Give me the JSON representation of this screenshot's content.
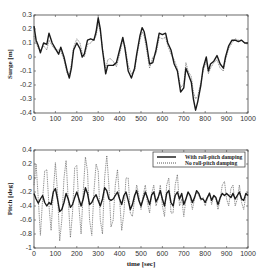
{
  "chart_data": [
    {
      "type": "line",
      "title": "",
      "xlabel": "",
      "ylabel": "Surge [m]",
      "xlim": [
        0,
        1000
      ],
      "ylim": [
        -0.4,
        0.3
      ],
      "xticks": [
        0,
        100,
        200,
        300,
        400,
        500,
        600,
        700,
        800,
        900,
        1000
      ],
      "yticks": [
        0.3,
        0.2,
        0.1,
        0,
        -0.1,
        -0.2,
        -0.3,
        -0.4
      ],
      "ytick_labels": [
        "0.3",
        "0.2",
        "0.1",
        "0",
        "-0.1",
        "-0.2",
        "-0.3",
        "-0.4"
      ],
      "grid": false,
      "legend": null,
      "x": [
        0,
        10,
        20,
        30,
        45,
        60,
        70,
        85,
        100,
        115,
        125,
        140,
        155,
        165,
        175,
        185,
        200,
        215,
        225,
        235,
        250,
        265,
        280,
        290,
        300,
        310,
        320,
        335,
        345,
        355,
        370,
        385,
        400,
        415,
        425,
        440,
        455,
        470,
        480,
        495,
        505,
        515,
        525,
        540,
        555,
        570,
        585,
        600,
        615,
        625,
        640,
        655,
        670,
        685,
        700,
        710,
        720,
        735,
        745,
        755,
        765,
        780,
        790,
        805,
        815,
        825,
        840,
        855,
        870,
        885,
        895,
        910,
        925,
        940,
        955,
        970,
        985,
        1000
      ],
      "series": [
        {
          "name": "With roll-pitch damping",
          "style": "solid",
          "values": [
            0.22,
            0.12,
            0.08,
            0.03,
            0.1,
            0.09,
            0.17,
            0.1,
            0.06,
            0.02,
            0.07,
            0.0,
            -0.1,
            -0.15,
            -0.08,
            0.05,
            0.1,
            0.06,
            0.0,
            0.02,
            0.12,
            0.13,
            0.12,
            0.18,
            0.28,
            0.2,
            0.05,
            -0.12,
            -0.06,
            -0.06,
            -0.06,
            -0.04,
            0.05,
            0.14,
            0.06,
            -0.1,
            -0.15,
            -0.08,
            0.02,
            0.15,
            0.21,
            0.18,
            0.1,
            -0.05,
            -0.04,
            0.05,
            0.17,
            0.16,
            0.17,
            0.1,
            0.05,
            -0.05,
            -0.1,
            -0.25,
            -0.22,
            -0.08,
            -0.12,
            -0.18,
            -0.3,
            -0.38,
            -0.32,
            -0.2,
            -0.08,
            0.0,
            -0.1,
            -0.05,
            -0.03,
            0.01,
            -0.05,
            -0.08,
            0.0,
            0.08,
            0.12,
            0.12,
            0.11,
            0.12,
            0.1,
            0.1
          ]
        },
        {
          "name": "No roll-pitch damping",
          "style": "dotted",
          "values": [
            0.15,
            0.1,
            0.06,
            0.05,
            0.08,
            0.05,
            0.12,
            0.08,
            0.05,
            0.05,
            0.04,
            -0.02,
            -0.12,
            -0.13,
            -0.05,
            0.07,
            0.13,
            0.1,
            0.03,
            0.0,
            0.09,
            0.1,
            0.13,
            0.15,
            0.24,
            0.18,
            0.06,
            -0.08,
            -0.02,
            -0.01,
            -0.03,
            -0.07,
            0.02,
            0.12,
            0.08,
            -0.06,
            -0.12,
            -0.1,
            0.0,
            0.12,
            0.18,
            0.15,
            0.06,
            -0.08,
            0.0,
            0.02,
            0.14,
            0.13,
            0.14,
            0.08,
            0.02,
            -0.02,
            -0.08,
            -0.22,
            -0.19,
            -0.04,
            -0.1,
            -0.14,
            -0.25,
            -0.3,
            -0.28,
            -0.18,
            -0.1,
            -0.03,
            -0.12,
            -0.08,
            -0.04,
            -0.02,
            -0.08,
            -0.1,
            -0.02,
            0.06,
            0.1,
            0.13,
            0.12,
            0.12,
            0.1,
            0.09
          ]
        }
      ]
    },
    {
      "type": "line",
      "title": "",
      "xlabel": "time [sec]",
      "ylabel": "Pitch [deg]",
      "xlim": [
        0,
        1000
      ],
      "ylim": [
        -1,
        0.4
      ],
      "xticks": [
        0,
        100,
        200,
        300,
        400,
        500,
        600,
        700,
        800,
        900,
        1000
      ],
      "yticks": [
        0.4,
        0.2,
        0,
        -0.2,
        -0.4,
        -0.6,
        -0.8,
        -1
      ],
      "ytick_labels": [
        "0.4",
        "0.2",
        "0",
        "-0.2",
        "-0.4",
        "-0.6",
        "-0.8",
        "-1"
      ],
      "grid": false,
      "legend": {
        "position": "upper right",
        "entries": [
          "With roll-pitch damping",
          "No roll-pitch damping"
        ]
      },
      "x": [
        0,
        10,
        20,
        30,
        40,
        50,
        60,
        70,
        80,
        90,
        100,
        110,
        120,
        130,
        140,
        150,
        160,
        170,
        180,
        190,
        200,
        210,
        220,
        230,
        240,
        250,
        260,
        270,
        280,
        290,
        300,
        310,
        320,
        330,
        340,
        350,
        360,
        370,
        380,
        390,
        400,
        410,
        420,
        430,
        440,
        450,
        460,
        470,
        480,
        490,
        500,
        510,
        520,
        530,
        540,
        550,
        560,
        570,
        580,
        590,
        600,
        610,
        620,
        630,
        640,
        650,
        660,
        670,
        680,
        690,
        700,
        710,
        720,
        730,
        740,
        750,
        760,
        770,
        780,
        790,
        800,
        810,
        820,
        830,
        840,
        850,
        860,
        870,
        880,
        890,
        900,
        910,
        920,
        930,
        940,
        950,
        960,
        970,
        980,
        990,
        1000
      ],
      "series": [
        {
          "name": "With roll-pitch damping",
          "style": "solid",
          "values": [
            -0.22,
            -0.3,
            -0.36,
            -0.3,
            -0.25,
            -0.35,
            -0.4,
            -0.35,
            -0.38,
            -0.2,
            -0.15,
            -0.3,
            -0.48,
            -0.45,
            -0.35,
            -0.22,
            -0.3,
            -0.42,
            -0.38,
            -0.28,
            -0.2,
            -0.3,
            -0.4,
            -0.3,
            -0.14,
            -0.22,
            -0.38,
            -0.35,
            -0.28,
            -0.24,
            -0.32,
            -0.4,
            -0.3,
            -0.14,
            -0.18,
            -0.3,
            -0.32,
            -0.3,
            -0.25,
            -0.2,
            -0.3,
            -0.38,
            -0.25,
            -0.2,
            -0.32,
            -0.45,
            -0.38,
            -0.25,
            -0.18,
            -0.32,
            -0.4,
            -0.3,
            -0.2,
            -0.28,
            -0.38,
            -0.24,
            -0.2,
            -0.34,
            -0.28,
            -0.18,
            -0.3,
            -0.4,
            -0.22,
            -0.18,
            -0.35,
            -0.4,
            -0.25,
            -0.2,
            -0.3,
            -0.22,
            -0.38,
            -0.3,
            -0.2,
            -0.25,
            -0.35,
            -0.28,
            -0.18,
            -0.22,
            -0.3,
            -0.3,
            -0.35,
            -0.28,
            -0.22,
            -0.32,
            -0.25,
            -0.28,
            -0.38,
            -0.28,
            -0.22,
            -0.25,
            -0.22,
            -0.25,
            -0.28,
            -0.22,
            -0.3,
            -0.25,
            -0.2,
            -0.3,
            -0.32,
            -0.22,
            -0.25
          ]
        },
        {
          "name": "No roll-pitch damping",
          "style": "dotted",
          "values": [
            -0.1,
            0.2,
            -0.3,
            -0.82,
            -0.3,
            0.1,
            0.12,
            -0.4,
            -0.75,
            -0.2,
            0.22,
            -0.2,
            -0.9,
            -0.6,
            0.0,
            0.25,
            -0.3,
            -0.85,
            -0.5,
            0.15,
            0.18,
            -0.4,
            -0.8,
            -0.2,
            0.3,
            0.1,
            -0.6,
            -0.82,
            -0.2,
            0.2,
            0.1,
            -0.6,
            -0.8,
            0.0,
            0.32,
            -0.1,
            -0.7,
            -0.6,
            -0.1,
            0.12,
            -0.3,
            -0.75,
            -0.5,
            0.0,
            0.0,
            -0.5,
            -0.55,
            -0.3,
            -0.1,
            -0.25,
            -0.45,
            -0.25,
            -0.1,
            -0.35,
            -0.5,
            -0.22,
            -0.1,
            -0.4,
            -0.3,
            -0.1,
            -0.4,
            -0.55,
            -0.1,
            0.0,
            -0.5,
            -0.5,
            -0.1,
            0.05,
            -0.4,
            -0.3,
            -0.55,
            -0.3,
            -0.2,
            -0.28,
            -0.45,
            -0.3,
            -0.2,
            -0.25,
            -0.32,
            -0.28,
            -0.4,
            -0.3,
            -0.2,
            -0.38,
            -0.25,
            -0.3,
            -0.45,
            -0.3,
            -0.1,
            -0.05,
            -0.3,
            -0.4,
            -0.15,
            -0.1,
            -0.4,
            -0.3,
            -0.1,
            -0.35,
            -0.45,
            -0.25,
            -0.2
          ]
        }
      ]
    }
  ],
  "labels": {
    "top_ylabel": "Surge [m]",
    "bottom_ylabel": "Pitch [deg]",
    "bottom_xlabel": "time [sec]",
    "legend_solid": "With roll-pitch damping",
    "legend_dotted": "No roll-pitch damping"
  }
}
